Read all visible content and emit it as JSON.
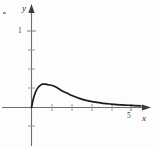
{
  "figure": {
    "background_color": "#fdfdfd",
    "curve_color": "#1a1a1a",
    "axis_color": "#6e6e6e",
    "text_color": "#2b2b2b"
  },
  "labels": {
    "x_axis": "x",
    "y_axis": "y",
    "y_tick_1": "1",
    "x_tick_5": "5"
  },
  "chart_data": {
    "type": "line",
    "title": "",
    "xlabel": "x",
    "ylabel": "y",
    "xlim": [
      -0.35,
      5.75
    ],
    "ylim": [
      -0.52,
      1.36
    ],
    "grid": false,
    "legend": null,
    "x_ticks": [
      1,
      2,
      3,
      4,
      5
    ],
    "x_tick_labels": [
      "",
      "",
      "",
      "",
      "5"
    ],
    "y_ticks": [
      -0.25,
      0.25,
      0.5,
      0.75,
      1
    ],
    "y_tick_labels": [
      "",
      "",
      "",
      "",
      "1"
    ],
    "axis_arrows": [
      "x-positive",
      "y-positive"
    ],
    "series": [
      {
        "name": "curve",
        "description": "rises steeply from origin to a peak near x=1 then decays asymptotically toward zero",
        "x": [
          0,
          0.1,
          0.2,
          0.3,
          0.4,
          0.5,
          0.6,
          0.7,
          0.8,
          0.9,
          1.0,
          1.2,
          1.4,
          1.6,
          1.8,
          2.0,
          2.4,
          2.8,
          3.2,
          3.6,
          4.0,
          4.5,
          5.0,
          5.5
        ],
        "y": [
          0,
          0.12,
          0.2,
          0.25,
          0.28,
          0.3,
          0.305,
          0.305,
          0.3,
          0.295,
          0.29,
          0.27,
          0.24,
          0.21,
          0.185,
          0.16,
          0.12,
          0.09,
          0.07,
          0.055,
          0.045,
          0.035,
          0.028,
          0.022
        ]
      }
    ],
    "peak": {
      "x": 0.65,
      "y": 0.305
    }
  }
}
